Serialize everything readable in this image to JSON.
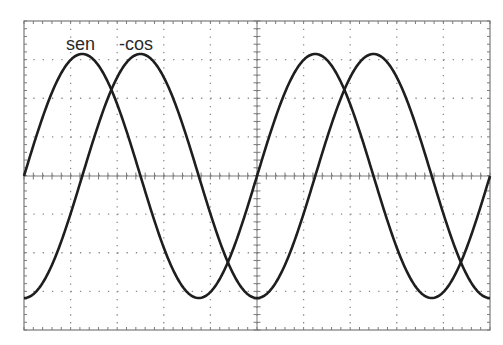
{
  "chart_data": {
    "type": "line",
    "title": "",
    "xlabel": "",
    "ylabel": "",
    "grid": true,
    "grid_style": "dotted",
    "divisions": {
      "x": 10,
      "y": 8
    },
    "minor_ticks_per_division": 5,
    "x_range_periods": [
      0,
      2
    ],
    "ylim": [
      -1,
      1
    ],
    "legend": "inline labels near first peaks (top-left)",
    "series": [
      {
        "name": "sen",
        "function": "sin(θ)",
        "phase_shift_periods": 0,
        "amplitude": 1,
        "periods_shown": 2,
        "label_position": "above first peak"
      },
      {
        "name": "-cos",
        "function": "-cos(θ)",
        "phase_shift_periods": 0.25,
        "amplitude": 1,
        "periods_shown": 2,
        "label_position": "above first peak"
      }
    ],
    "x": [
      0,
      0.125,
      0.25,
      0.375,
      0.5,
      0.625,
      0.75,
      0.875,
      1.0,
      1.125,
      1.25,
      1.375,
      1.5,
      1.625,
      1.75,
      1.875,
      2.0
    ],
    "x_unit": "periods",
    "values_sen": [
      0,
      0.707,
      1,
      0.707,
      0,
      -0.707,
      -1,
      -0.707,
      0,
      0.707,
      1,
      0.707,
      0,
      -0.707,
      -1,
      -0.707,
      0
    ],
    "values_neg_cos": [
      -1,
      -0.707,
      0,
      0.707,
      1,
      0.707,
      0,
      -0.707,
      -1,
      -0.707,
      0,
      0.707,
      1,
      0.707,
      0,
      -0.707,
      -1
    ]
  },
  "labels": {
    "sen": "sen",
    "neg_cos": "-cos"
  },
  "style": {
    "trace_color": "#1e1e1e",
    "grid_color": "#8a8a8a",
    "frame_color": "#7a7a7a",
    "background": "#ffffff"
  }
}
